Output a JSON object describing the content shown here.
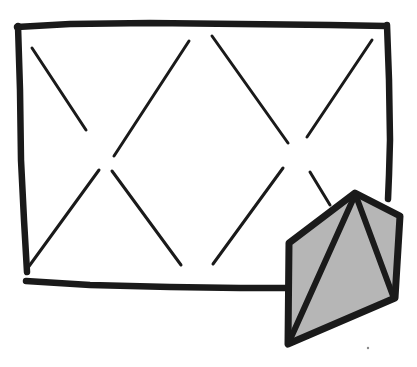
{
  "image": {
    "kind": "hand-drawn-sketch",
    "title": "Hand-drawn rectangle with X hatch lines and shaded pyramid",
    "width": 417,
    "height": 367,
    "background_color": "#ffffff",
    "ink_color": "#1a1a1a",
    "shade_color": "#b6b6b6"
  },
  "frame": {
    "name": "outer-rectangle",
    "description": "Hand-drawn open rectangle, bottom edge stops where the shaded pyramid overlaps",
    "edges": [
      {
        "name": "top-edge",
        "points": "17,27 70,24 150,23 240,24 330,25 386,26"
      },
      {
        "name": "left-edge",
        "points": "18,26 20,90 21,160 24,220 27,272"
      },
      {
        "name": "bottom-edge",
        "points": "26,281 90,285 170,287 240,288 286,288"
      },
      {
        "name": "right-edge",
        "points": "387,25 389,80 390,140 389,175 388,199"
      }
    ]
  },
  "hatch_lines": [
    {
      "name": "hatch-line-1",
      "from": [
        32,
        48
      ],
      "to": [
        86,
        130
      ],
      "direction": "down-right"
    },
    {
      "name": "hatch-line-2",
      "from": [
        114,
        156
      ],
      "to": [
        189,
        41
      ],
      "direction": "up-right"
    },
    {
      "name": "hatch-line-3",
      "from": [
        212,
        36
      ],
      "to": [
        288,
        143
      ],
      "direction": "down-right"
    },
    {
      "name": "hatch-line-4",
      "from": [
        307,
        137
      ],
      "to": [
        372,
        40
      ],
      "direction": "up-right"
    },
    {
      "name": "hatch-line-5",
      "from": [
        27,
        269
      ],
      "to": [
        99,
        170
      ],
      "direction": "up-right"
    },
    {
      "name": "hatch-line-6",
      "from": [
        112,
        171
      ],
      "to": [
        181,
        265
      ],
      "direction": "down-right"
    },
    {
      "name": "hatch-line-7",
      "from": [
        213,
        264
      ],
      "to": [
        283,
        168
      ],
      "direction": "up-right"
    },
    {
      "name": "hatch-line-8",
      "from": [
        310,
        172
      ],
      "to": [
        330,
        205
      ],
      "direction": "down-right"
    }
  ],
  "pyramid": {
    "name": "shaded-pyramid",
    "description": "Shaded five-sided polygon resembling a pyramid or tent, overlapping the lower right corner of the rectangle",
    "fill_color": "#b6b6b6",
    "outline_color": "#1a1a1a",
    "vertices": [
      {
        "name": "apex",
        "x": 355,
        "y": 193
      },
      {
        "name": "right-shoulder",
        "x": 400,
        "y": 216
      },
      {
        "name": "bottom-right",
        "x": 395,
        "y": 298
      },
      {
        "name": "bottom-left",
        "x": 288,
        "y": 344
      },
      {
        "name": "left-shoulder",
        "x": 289,
        "y": 243
      }
    ],
    "internal_ribs": [
      {
        "name": "rib-apex-to-bottom-left",
        "from": [
          355,
          195
        ],
        "to": [
          289,
          342
        ]
      },
      {
        "name": "rib-apex-to-bottom-right",
        "from": [
          356,
          196
        ],
        "to": [
          393,
          296
        ]
      }
    ]
  },
  "marks": [
    {
      "name": "stray-speck",
      "x": 368,
      "y": 348,
      "radius": 1.2
    }
  ]
}
